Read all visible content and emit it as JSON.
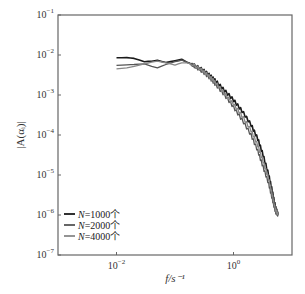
{
  "chart_data": {
    "type": "line",
    "title": "",
    "xlabel": "f/s⁻¹",
    "ylabel": "|A(αᵢ)|",
    "xscale": "log",
    "yscale": "log",
    "xlim": [
      0.001,
      10
    ],
    "ylim": [
      1e-07,
      0.1
    ],
    "grid": false,
    "legend_position": "lower left",
    "x_ticks": [
      {
        "value": 0.01,
        "label_base": "10",
        "label_exp": "−2"
      },
      {
        "value": 1,
        "label_base": "10",
        "label_exp": "0"
      }
    ],
    "y_ticks": [
      {
        "value": 0.1,
        "label_base": "10",
        "label_exp": "−1"
      },
      {
        "value": 0.01,
        "label_base": "10",
        "label_exp": "−2"
      },
      {
        "value": 0.001,
        "label_base": "10",
        "label_exp": "−3"
      },
      {
        "value": 0.0001,
        "label_base": "10",
        "label_exp": "−4"
      },
      {
        "value": 1e-05,
        "label_base": "10",
        "label_exp": "−5"
      },
      {
        "value": 1e-06,
        "label_base": "10",
        "label_exp": "−6"
      },
      {
        "value": 1e-07,
        "label_base": "10",
        "label_exp": "−7"
      }
    ],
    "series": [
      {
        "name": "N=1000个",
        "color": "#1a1a1a",
        "x": [
          0.01,
          0.015,
          0.02,
          0.03,
          0.04,
          0.05,
          0.07,
          0.1,
          0.13,
          0.16,
          0.2,
          0.3,
          0.4,
          0.5,
          0.7,
          1.0,
          1.4,
          2.0,
          2.6,
          3.2,
          4.0,
          4.6,
          5.2,
          5.8
        ],
        "y": [
          0.0085,
          0.0086,
          0.0082,
          0.0068,
          0.007,
          0.0074,
          0.0065,
          0.0072,
          0.0078,
          0.0066,
          0.0058,
          0.0042,
          0.003,
          0.0022,
          0.0013,
          0.00075,
          0.0004,
          0.00018,
          8e-05,
          3.2e-05,
          1e-05,
          4e-06,
          1.6e-06,
          1e-06
        ]
      },
      {
        "name": "N=2000个",
        "color": "#555555",
        "x": [
          0.01,
          0.015,
          0.02,
          0.03,
          0.04,
          0.05,
          0.07,
          0.1,
          0.13,
          0.16,
          0.2,
          0.3,
          0.4,
          0.5,
          0.7,
          1.0,
          1.4,
          2.0,
          2.6,
          3.2,
          4.0,
          4.6,
          5.2,
          5.8
        ],
        "y": [
          0.0055,
          0.0057,
          0.0058,
          0.006,
          0.0052,
          0.0048,
          0.0058,
          0.0068,
          0.0074,
          0.0066,
          0.0056,
          0.0038,
          0.0026,
          0.0018,
          0.001,
          0.0005,
          0.00024,
          0.0001,
          4e-05,
          1.6e-05,
          6e-06,
          2.5e-06,
          1.2e-06,
          1e-06
        ]
      },
      {
        "name": "N=4000个",
        "color": "#888888",
        "x": [
          0.01,
          0.015,
          0.02,
          0.03,
          0.04,
          0.05,
          0.07,
          0.1,
          0.13,
          0.16,
          0.2,
          0.3,
          0.4,
          0.5,
          0.7,
          1.0,
          1.4,
          2.0,
          2.6,
          3.2,
          4.0,
          4.6,
          5.2,
          5.8
        ],
        "y": [
          0.0045,
          0.0048,
          0.0052,
          0.006,
          0.0066,
          0.007,
          0.0064,
          0.0056,
          0.0064,
          0.0064,
          0.0058,
          0.004,
          0.0028,
          0.002,
          0.0011,
          0.0006,
          0.0003,
          0.00013,
          5.5e-05,
          2.2e-05,
          8e-06,
          3.2e-06,
          1.4e-06,
          1e-06
        ]
      }
    ]
  }
}
